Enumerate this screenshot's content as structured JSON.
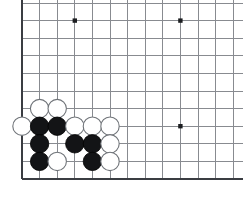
{
  "board": {
    "kind": "go-board-corner-diagram",
    "label": "Go board lower-left corner position",
    "colors": {
      "background": "#ffffff",
      "grid_line": "#888b90",
      "border_line": "#3a3d42",
      "star_point": "#1b1d20",
      "black_stone": "#131416",
      "white_stone": "#ffffff",
      "white_stone_outline": "#6f7378"
    },
    "geometry": {
      "width": 243,
      "height": 213,
      "origin_x": 22,
      "origin_y": 3,
      "spacing": 17.6,
      "columns": 13,
      "rows": 11,
      "stone_radius": 9.2,
      "bottom_edge_row": 10,
      "left_edge_col": 0
    },
    "edges": {
      "left": true,
      "bottom": true,
      "top": false,
      "right": false
    },
    "star_points": [
      {
        "col": 3,
        "row": 1
      },
      {
        "col": 9,
        "row": 1
      },
      {
        "col": 3,
        "row": 7
      },
      {
        "col": 9,
        "row": 7
      }
    ],
    "stones": [
      {
        "col": 1,
        "row": 6,
        "color": "white"
      },
      {
        "col": 2,
        "row": 6,
        "color": "white"
      },
      {
        "col": 0,
        "row": 7,
        "color": "white"
      },
      {
        "col": 1,
        "row": 7,
        "color": "black"
      },
      {
        "col": 2,
        "row": 7,
        "color": "black"
      },
      {
        "col": 3,
        "row": 7,
        "color": "white"
      },
      {
        "col": 4,
        "row": 7,
        "color": "white"
      },
      {
        "col": 5,
        "row": 7,
        "color": "white"
      },
      {
        "col": 1,
        "row": 8,
        "color": "black"
      },
      {
        "col": 3,
        "row": 8,
        "color": "black"
      },
      {
        "col": 4,
        "row": 8,
        "color": "black"
      },
      {
        "col": 5,
        "row": 8,
        "color": "white"
      },
      {
        "col": 1,
        "row": 9,
        "color": "black"
      },
      {
        "col": 2,
        "row": 9,
        "color": "white"
      },
      {
        "col": 4,
        "row": 9,
        "color": "black"
      },
      {
        "col": 5,
        "row": 9,
        "color": "white"
      }
    ]
  }
}
